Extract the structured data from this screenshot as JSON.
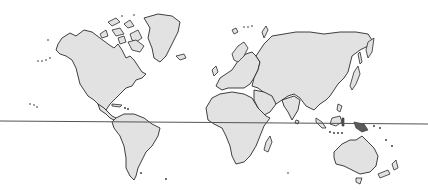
{
  "map": {
    "type": "world-outline",
    "colors": {
      "background": "#ffffff",
      "land_fill": "#e2e2e2",
      "coastline": "#2a2a2a",
      "highlight": "#5a5a5a",
      "reference_line": "#555555"
    },
    "reference_line": {
      "x1": 0,
      "y1": 121,
      "x2": 428,
      "y2": 124
    },
    "regions": [
      "north-america",
      "greenland",
      "arctic-archipelago",
      "south-america",
      "europe",
      "africa",
      "madagascar",
      "asia",
      "japan",
      "indonesia",
      "new-guinea",
      "australia",
      "new-zealand",
      "tasmania",
      "iceland",
      "uk"
    ]
  }
}
